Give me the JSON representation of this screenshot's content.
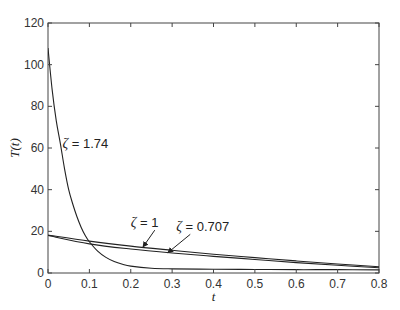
{
  "chart_data": {
    "type": "line",
    "title": "",
    "xlabel": "t",
    "ylabel": "T(t)",
    "xlim": [
      0,
      0.8
    ],
    "ylim": [
      0,
      120
    ],
    "xticks": [
      0,
      0.1,
      0.2,
      0.3,
      0.4,
      0.5,
      0.6,
      0.7,
      0.8
    ],
    "xtick_labels": [
      "0",
      "0.1",
      "0.2",
      "0.3",
      "0.4",
      "0.5",
      "0.6",
      "0.7",
      "0.8"
    ],
    "yticks": [
      0,
      20,
      40,
      60,
      80,
      100,
      120
    ],
    "ytick_labels": [
      "0",
      "20",
      "40",
      "60",
      "80",
      "100",
      "120"
    ],
    "grid": false,
    "legend": null,
    "series": [
      {
        "name": "ζ = 1.74",
        "x": [
          0,
          0.01,
          0.02,
          0.03,
          0.04,
          0.05,
          0.06,
          0.07,
          0.08,
          0.09,
          0.1,
          0.12,
          0.14,
          0.16,
          0.18,
          0.2,
          0.25,
          0.3,
          0.4,
          0.5,
          0.6,
          0.7,
          0.8
        ],
        "values": [
          108,
          88,
          73,
          62,
          50,
          40,
          33,
          27,
          22,
          18,
          15,
          10.5,
          7.5,
          5.5,
          4.2,
          3.3,
          2.3,
          2.0,
          1.8,
          1.7,
          1.6,
          1.6,
          1.5
        ]
      },
      {
        "name": "ζ = 1",
        "x": [
          0,
          0.1,
          0.2,
          0.3,
          0.4,
          0.5,
          0.6,
          0.7,
          0.8
        ],
        "values": [
          18.2,
          15.3,
          12.9,
          10.9,
          9.0,
          7.4,
          5.8,
          4.3,
          3.0
        ]
      },
      {
        "name": "ζ = 0.707",
        "x": [
          0,
          0.1,
          0.2,
          0.3,
          0.4,
          0.5,
          0.6,
          0.7,
          0.8
        ],
        "values": [
          18.0,
          14.0,
          11.5,
          9.6,
          8.0,
          6.5,
          5.0,
          3.7,
          2.5
        ]
      }
    ],
    "annotations": [
      {
        "text": "ζ = 1.74",
        "x": 0.035,
        "y": 60,
        "arrow": false
      },
      {
        "text": "ζ = 1",
        "x": 0.2,
        "y": 22,
        "arrow_to": [
          0.23,
          12.6
        ]
      },
      {
        "text": "ζ = 0.707",
        "x": 0.31,
        "y": 20,
        "arrow_to": [
          0.29,
          9.8
        ]
      }
    ]
  }
}
